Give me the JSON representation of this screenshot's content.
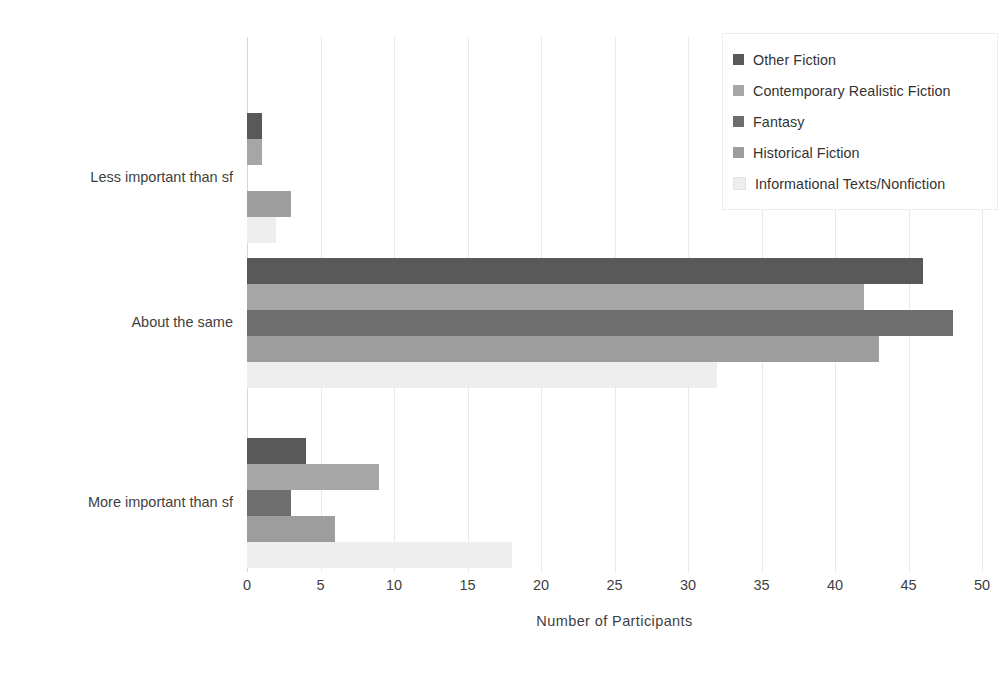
{
  "chart_data": {
    "type": "bar",
    "orientation": "horizontal",
    "title": "",
    "xlabel": "Number of Participants",
    "ylabel": "",
    "xlim": [
      0,
      50
    ],
    "xticks": [
      0,
      5,
      10,
      15,
      20,
      25,
      30,
      35,
      40,
      45,
      50
    ],
    "grid": true,
    "legend_position": "top-right",
    "categories": [
      "Less important than sf",
      "About the same",
      "More important than sf"
    ],
    "series": [
      {
        "name": "Other Fiction",
        "color": "#595959",
        "values": [
          1,
          46,
          4
        ]
      },
      {
        "name": "Contemporary Realistic Fiction",
        "color": "#a6a6a6",
        "values": [
          1,
          42,
          9
        ]
      },
      {
        "name": "Fantasy",
        "color": "#6e6e6e",
        "values": [
          0,
          48,
          3
        ]
      },
      {
        "name": "Historical Fiction",
        "color": "#9d9d9d",
        "values": [
          3,
          43,
          6
        ]
      },
      {
        "name": "Informational Texts/Nonfiction",
        "color": "#eeeeee",
        "values": [
          2,
          32,
          18
        ]
      }
    ]
  },
  "axis": {
    "x_title": "Number of Participants",
    "tick_labels": [
      "0",
      "5",
      "10",
      "15",
      "20",
      "25",
      "30",
      "35",
      "40",
      "45",
      "50"
    ],
    "category_labels": [
      "Less important than sf",
      "About the same",
      "More important than sf"
    ]
  },
  "legend": {
    "items": [
      {
        "label": "Other Fiction",
        "swatch": "#595959"
      },
      {
        "label": "Contemporary Realistic Fiction",
        "swatch": "#a6a6a6"
      },
      {
        "label": "Fantasy",
        "swatch": "#6e6e6e"
      },
      {
        "label": "Historical Fiction",
        "swatch": "#9d9d9d"
      },
      {
        "label": "Informational Texts/Nonfiction",
        "swatch": "#eeeeee"
      }
    ]
  }
}
